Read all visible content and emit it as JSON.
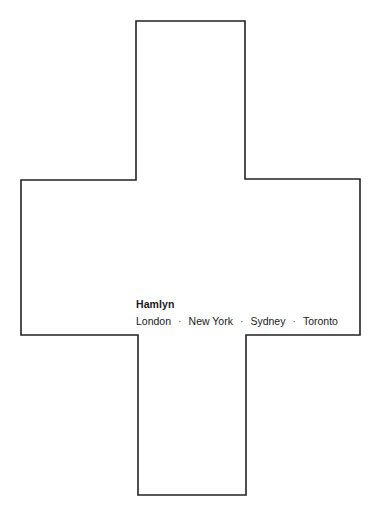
{
  "page": {
    "shape": "cross",
    "line_color": "#222222",
    "background": "#ffffff"
  },
  "imprint": {
    "publisher": "Hamlyn",
    "cities": [
      "London",
      "New York",
      "Sydney",
      "Toronto"
    ],
    "separator": "·"
  }
}
